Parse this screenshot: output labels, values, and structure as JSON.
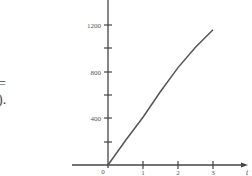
{
  "fragments": {
    "equals": "=",
    "paren_period": ")."
  },
  "chart_data": {
    "type": "line",
    "title": "",
    "xlabel": "t",
    "ylabel": "",
    "x_ticks": [
      "1",
      "2",
      "3"
    ],
    "y_ticks": [
      "400",
      "800",
      "1200"
    ],
    "y_minor_ticks": [
      200,
      600,
      1000,
      1400
    ],
    "origin_label": "0",
    "xlim": [
      0,
      4
    ],
    "ylim": [
      0,
      1400
    ],
    "grid": false,
    "legend": "none",
    "series": [
      {
        "name": "curve",
        "x": [
          0,
          0.5,
          1,
          1.5,
          2,
          2.5,
          3
        ],
        "y": [
          0,
          210,
          410,
          630,
          835,
          1010,
          1160
        ]
      }
    ],
    "line_color": "#555555",
    "axis_color": "#444444"
  }
}
